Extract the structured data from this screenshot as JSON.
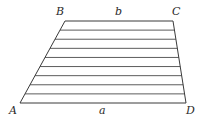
{
  "diagram": {
    "type": "trapezoid-with-parallel-lines",
    "vertices": {
      "A": {
        "label": "A",
        "x": 20,
        "y": 103
      },
      "B": {
        "label": "B",
        "x": 65,
        "y": 21
      },
      "C": {
        "label": "C",
        "x": 173,
        "y": 21
      },
      "D": {
        "label": "D",
        "x": 186,
        "y": 103
      }
    },
    "sides": {
      "top": {
        "label": "b",
        "from": "B",
        "to": "C"
      },
      "bottom": {
        "label": "a",
        "from": "A",
        "to": "D"
      }
    },
    "parallel_line_count": 10,
    "colors": {
      "stroke": "#3a3a3a",
      "background": "#ffffff",
      "text": "#2a2a2a"
    }
  }
}
